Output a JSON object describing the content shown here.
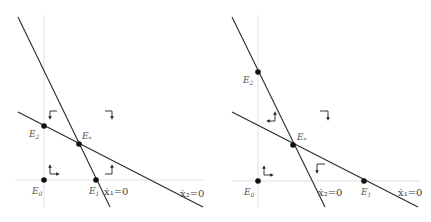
{
  "panels": [
    {
      "id": "left",
      "points": [
        {
          "name": "E2",
          "label": "E",
          "sub": "2"
        },
        {
          "name": "Estar",
          "label": "E",
          "sub": "*"
        },
        {
          "name": "E0",
          "label": "E",
          "sub": "0"
        },
        {
          "name": "E1",
          "label": "E",
          "sub": "1"
        }
      ],
      "nullclines": [
        {
          "name": "steep",
          "label": "ẋ₁=0"
        },
        {
          "name": "shallow",
          "label": "ẋ₂=0"
        }
      ],
      "flow_arrows": [
        {
          "region": "upper-left",
          "direction": "right-down"
        },
        {
          "region": "upper-right",
          "direction": "left-down"
        },
        {
          "region": "lower-left",
          "direction": "right-up"
        },
        {
          "region": "lower-middle",
          "direction": "left-up"
        }
      ]
    },
    {
      "id": "right",
      "points": [
        {
          "name": "E2",
          "label": "E",
          "sub": "2"
        },
        {
          "name": "Estar",
          "label": "E",
          "sub": "*"
        },
        {
          "name": "E0",
          "label": "E",
          "sub": "0"
        },
        {
          "name": "E1",
          "label": "E",
          "sub": "1"
        }
      ],
      "nullclines": [
        {
          "name": "steep",
          "label": "ẋ₂=0"
        },
        {
          "name": "shallow",
          "label": "ẋ₁=0"
        }
      ],
      "flow_arrows": [
        {
          "region": "middle-left",
          "direction": "left-up"
        },
        {
          "region": "upper-right",
          "direction": "left-down"
        },
        {
          "region": "lower-left",
          "direction": "right-up"
        },
        {
          "region": "lower-middle",
          "direction": "right-down"
        }
      ]
    }
  ],
  "labels": {
    "left_E2": "E",
    "left_E2_sub": "2",
    "left_Estar": "E",
    "left_Estar_sub": "*",
    "left_E0": "E",
    "left_E0_sub": "0",
    "left_E1": "E",
    "left_E1_sub": "1",
    "left_steep_eq": "ẋ₁=0",
    "left_shallow_eq": "ẋ₂=0",
    "right_E2": "E",
    "right_E2_sub": "2",
    "right_Estar": "E",
    "right_Estar_sub": "*",
    "right_E0": "E",
    "right_E0_sub": "0",
    "right_E1": "E",
    "right_E1_sub": "1",
    "right_steep_eq": "ẋ₂=0",
    "right_shallow_eq": "ẋ₁=0"
  },
  "colors": {
    "line": "#2a2a2a",
    "axis": "#d8d8d8",
    "point": "#111111",
    "label": "#555555"
  }
}
